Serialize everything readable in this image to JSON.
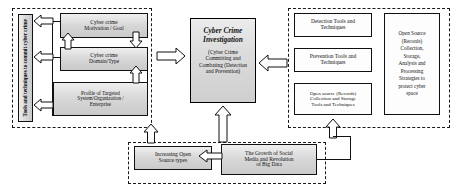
{
  "diagram": {
    "regions": {
      "left_region_name": "Cyber crime committing side",
      "right_region_name": "Cyber crime combating side",
      "bottom_region_name": "Open source drivers"
    },
    "left": {
      "vertical_label": "Tools and techniques to commit cyber crime",
      "boxes": [
        {
          "id": "motivation",
          "label": "Cyber crime\nMotivation / Goal"
        },
        {
          "id": "domain",
          "label": "Cyber crime\nDomain/Type"
        },
        {
          "id": "profile",
          "label": "Profile of Targeted\nSystem/Organization /\nEnterprise"
        }
      ]
    },
    "center": {
      "title": "Cyber Crime\nInvestigation",
      "subtitle": "(Cyber Crime\nCommitting and\nCombating (Detection\nand Prevention)"
    },
    "right": {
      "boxes": [
        {
          "id": "detection",
          "label": "Detection Tools and\nTechniques"
        },
        {
          "id": "prevention",
          "label": "Prevention Tools and\nTechniques"
        },
        {
          "id": "opensource-collection",
          "label": "Open source (Records)\nCollection and Storage\nTools and Techniques"
        }
      ],
      "vertical_label": "Open Source\n(Records)\nCollection,\nStorage,\nAnalysis and\nProcessing\nStrategies to\nprotect cyber\nspace"
    },
    "bottom": {
      "boxes": [
        {
          "id": "increasing-open-source",
          "label": "Increasing Open\nSource types"
        },
        {
          "id": "social-media-big-data",
          "label": "The Growth of Social\nMedia and Revolution\nof Big Data"
        }
      ]
    },
    "arrows": [
      {
        "id": "left-out-top",
        "direction": "left"
      },
      {
        "id": "left-out-mid",
        "direction": "left"
      },
      {
        "id": "left-out-bottom",
        "direction": "left"
      },
      {
        "id": "motivation-to-domain-down",
        "direction": "down"
      },
      {
        "id": "domain-to-motivation-up",
        "direction": "up"
      },
      {
        "id": "profile-to-domain-up",
        "direction": "up"
      },
      {
        "id": "left-to-center",
        "direction": "right"
      },
      {
        "id": "right-to-center",
        "direction": "left"
      },
      {
        "id": "increasing-to-center-up",
        "direction": "up"
      },
      {
        "id": "bigdata-to-center-up",
        "direction": "up"
      },
      {
        "id": "bigdata-to-increasing",
        "direction": "left"
      },
      {
        "id": "bigdata-to-opensource-up",
        "direction": "up"
      }
    ],
    "colors": {
      "box_fill_light": "#f0f0f0",
      "box_fill_dark": "#c9c9c9",
      "stroke": "#111111",
      "arrow_fill": "#fefefe",
      "background": "#ffffff"
    }
  }
}
